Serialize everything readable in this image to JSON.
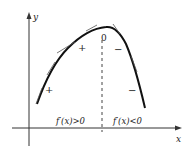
{
  "diagram": {
    "type": "function-graph",
    "axes": {
      "x_label": "x",
      "y_label": "y"
    },
    "peak_label": "0",
    "left_signs": [
      "+",
      "+"
    ],
    "right_signs": [
      "−",
      "−"
    ],
    "left_region_label": "f′(x)>0",
    "right_region_label": "f′(x)<0",
    "colors": {
      "curve": "#111111",
      "axis": "#333333",
      "dashed": "#444444",
      "tangent": "#555555",
      "text": "#222222"
    }
  }
}
